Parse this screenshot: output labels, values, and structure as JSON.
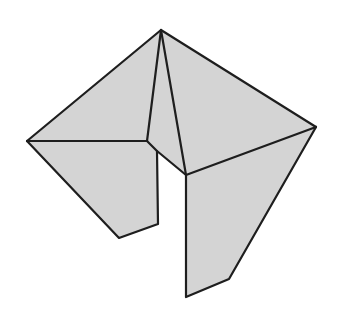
{
  "diagram": {
    "fill_color": "#d4d4d4",
    "stroke_color": "#1e1e1e",
    "background": "#ffffff",
    "faces": [
      {
        "name": "top-left-face",
        "points": "161,30 27,141 147,141"
      },
      {
        "name": "top-center-face",
        "points": "161,30 147,141 157,151 186,175"
      },
      {
        "name": "top-right-face",
        "points": "161,30 316,127 186,175"
      },
      {
        "name": "bottom-left-face",
        "points": "27,141 147,141 157,151 158,224 119,238"
      },
      {
        "name": "bottom-right-face",
        "points": "186,175 316,127 229,279 186,297"
      }
    ],
    "edges": [
      {
        "name": "edge-top-left",
        "points": "161,30 27,141"
      },
      {
        "name": "edge-top-right",
        "points": "161,30 316,127"
      },
      {
        "name": "edge-top-inner-left",
        "points": "161,30 147,141"
      },
      {
        "name": "edge-top-inner-right",
        "points": "161,30 186,175"
      },
      {
        "name": "edge-left-horizontal",
        "points": "27,141 147,141"
      },
      {
        "name": "edge-notch",
        "points": "147,141 157,151 186,175"
      },
      {
        "name": "edge-right-diagonal",
        "points": "316,127 186,175"
      },
      {
        "name": "edge-left-bottom",
        "points": "27,141 119,238 158,224 157,151"
      },
      {
        "name": "edge-right-bottom",
        "points": "316,127 229,279 186,297 186,175"
      }
    ]
  }
}
